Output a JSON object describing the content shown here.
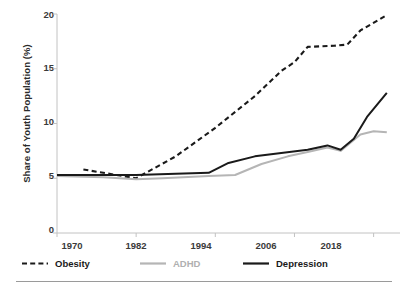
{
  "chart_data": {
    "type": "line",
    "title": "",
    "subtitle": "",
    "xlabel": "",
    "ylabel": "Share of Youth Population (%)",
    "xlim": [
      1970,
      2022
    ],
    "ylim": [
      0,
      20
    ],
    "xticks": [
      "1970",
      "1982",
      "1994",
      "2006",
      "2018"
    ],
    "xtick_values": [
      1970,
      1982,
      1994,
      2006,
      2018
    ],
    "yticks": [
      "0",
      "5",
      "10",
      "15",
      "20"
    ],
    "ytick_values": [
      0,
      5,
      10,
      15,
      20
    ],
    "grid": false,
    "legend_position": "bottom",
    "series": [
      {
        "name": "Obesity",
        "style": "dashed",
        "color": "#1a1a1a",
        "x": [
          1974,
          1976,
          1980,
          1982,
          1988,
          1994,
          2000,
          2004,
          2006,
          2008,
          2012,
          2014,
          2016,
          2020
        ],
        "values": [
          5.8,
          5.6,
          5.2,
          5.0,
          7.0,
          9.6,
          12.5,
          14.8,
          15.6,
          17.0,
          17.1,
          17.2,
          18.5,
          19.9
        ]
      },
      {
        "name": "ADHD",
        "style": "solid",
        "color": "#b5b5b5",
        "x": [
          1970,
          1977,
          1982,
          1986,
          1993,
          1997,
          2001,
          2005,
          2008,
          2011,
          2013,
          2016,
          2018,
          2020
        ],
        "values": [
          5.2,
          5.1,
          4.9,
          5.0,
          5.2,
          5.3,
          6.3,
          7.0,
          7.4,
          7.8,
          7.5,
          9.0,
          9.3,
          9.2
        ]
      },
      {
        "name": "Depression",
        "style": "solid",
        "color": "#1a1a1a",
        "x": [
          1970,
          1977,
          1982,
          1988,
          1993,
          1996,
          2000,
          2004,
          2008,
          2011,
          2013,
          2015,
          2017,
          2020
        ],
        "values": [
          5.3,
          5.3,
          5.3,
          5.4,
          5.5,
          6.4,
          7.0,
          7.3,
          7.6,
          8.0,
          7.6,
          8.6,
          10.6,
          12.8
        ]
      }
    ]
  },
  "legend": {
    "items": [
      {
        "label": "Obesity"
      },
      {
        "label": "ADHD"
      },
      {
        "label": "Depression"
      }
    ]
  },
  "footer": {
    "note": ""
  }
}
